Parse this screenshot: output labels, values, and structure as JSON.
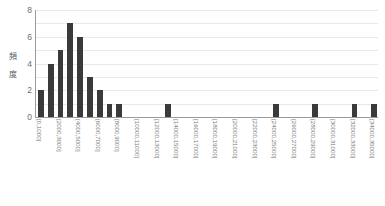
{
  "chart_data": {
    "type": "bar",
    "title": "",
    "subtitle": "",
    "xlabel": "",
    "ylabel": "頻　度",
    "ylim": [
      0,
      8
    ],
    "yticks": [
      0,
      2,
      4,
      6,
      8
    ],
    "grid": true,
    "legend": null,
    "bin_width": 1000,
    "categories": [
      "[0,1000]",
      "[1000,2000]",
      "[2000,3000]",
      "[3000,4000]",
      "[4000,5000]",
      "[5000,6000]",
      "[6000,7000]",
      "[7000,8000]",
      "[8000,9000]",
      "[9000,10000]",
      "[10000,11000]",
      "[11000,12000]",
      "[12000,13000]",
      "[13000,14000]",
      "[14000,15000]",
      "[15000,16000]",
      "[16000,17000]",
      "[17000,18000]",
      "[18000,19000]",
      "[19000,20000]",
      "[20000,21000]",
      "[21000,22000]",
      "[22000,23000]",
      "[23000,24000]",
      "[24000,25000]",
      "[25000,26000]",
      "[26000,27000]",
      "[27000,28000]",
      "[28000,29000]",
      "[29000,30000]",
      "[30000,31000]",
      "[31000,32000]",
      "[32000,33000]",
      "[33000,34000]",
      "[34000,35000]"
    ],
    "values": [
      2,
      4,
      5,
      7,
      6,
      3,
      2,
      1,
      1,
      0,
      0,
      0,
      0,
      1,
      0,
      0,
      0,
      0,
      0,
      0,
      0,
      0,
      0,
      0,
      1,
      0,
      0,
      0,
      1,
      0,
      0,
      0,
      1,
      0,
      1
    ],
    "tick_labels": [
      "[0,1000]",
      "[2000,3000]",
      "[4000,5000]",
      "[6000,7000]",
      "[8000,9000]",
      "[10000,11000]",
      "[12000,13000]",
      "[14000,15000]",
      "[16000,17000]",
      "[18000,19000]",
      "[20000,21000]",
      "[22000,23000]",
      "[24000,25000]",
      "[26000,27000]",
      "[28000,29000]",
      "[30000,31000]",
      "[32000,33000]",
      "[34000,35000]"
    ],
    "tick_bin_indices": [
      0,
      2,
      4,
      6,
      8,
      10,
      12,
      14,
      16,
      18,
      20,
      22,
      24,
      26,
      28,
      30,
      32,
      34
    ],
    "bar_color": "#3a3a3a",
    "grid_color": "#e9e9e9",
    "axis_color": "#9a9a9a"
  },
  "caption": ""
}
